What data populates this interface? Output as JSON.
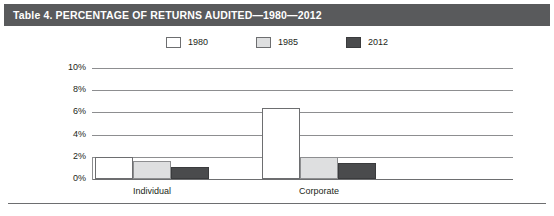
{
  "figure": {
    "title": "Table 4. PERCENTAGE OF RETURNS AUDITED—1980—2012",
    "title_bar_color": "#595a5c",
    "background": "#ffffff"
  },
  "legend": {
    "position": "top-center",
    "items": [
      {
        "label": "1980",
        "color": "#ffffff",
        "swatch_name": "legend-swatch-1980"
      },
      {
        "label": "1985",
        "color": "#dedfe0",
        "swatch_name": "legend-swatch-1985"
      },
      {
        "label": "2012",
        "color": "#4a4b4d",
        "swatch_name": "legend-swatch-2012"
      }
    ]
  },
  "chart_data": {
    "type": "bar",
    "title": "Table 4. PERCENTAGE OF RETURNS AUDITED—1980—2012",
    "xlabel": "",
    "ylabel": "",
    "categories": [
      "Individual",
      "Corporate"
    ],
    "series": [
      {
        "name": "1980",
        "color": "#ffffff",
        "values": [
          2.0,
          6.4
        ]
      },
      {
        "name": "1985",
        "color": "#dedfe0",
        "values": [
          1.6,
          2.0
        ]
      },
      {
        "name": "2012",
        "color": "#4a4b4d",
        "values": [
          1.1,
          1.4
        ]
      }
    ],
    "ylim": [
      0,
      10
    ],
    "yticks": [
      0,
      2,
      4,
      6,
      8,
      10
    ],
    "ytick_labels": [
      "0%",
      "2%",
      "4%",
      "6%",
      "8%",
      "10%"
    ],
    "grid": true,
    "grid_axis": "y",
    "legend_position": "top-center"
  }
}
